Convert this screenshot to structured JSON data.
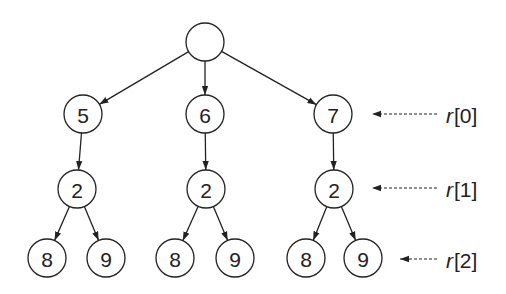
{
  "diagram": {
    "type": "tree",
    "colors": {
      "stroke": "#222222",
      "fill": "#ffffff",
      "background": "#ffffff"
    },
    "nodes": [
      {
        "id": "root",
        "label": "",
        "x": 205,
        "y": 42
      },
      {
        "id": "n5",
        "label": "5",
        "x": 83,
        "y": 114
      },
      {
        "id": "n6",
        "label": "6",
        "x": 205,
        "y": 114
      },
      {
        "id": "n7",
        "label": "7",
        "x": 333,
        "y": 114
      },
      {
        "id": "a2",
        "label": "2",
        "x": 77,
        "y": 189
      },
      {
        "id": "b2",
        "label": "2",
        "x": 206,
        "y": 189
      },
      {
        "id": "c2",
        "label": "2",
        "x": 334,
        "y": 189
      },
      {
        "id": "a8",
        "label": "8",
        "x": 47,
        "y": 258
      },
      {
        "id": "a9",
        "label": "9",
        "x": 106,
        "y": 258
      },
      {
        "id": "b8",
        "label": "8",
        "x": 175,
        "y": 258
      },
      {
        "id": "b9",
        "label": "9",
        "x": 235,
        "y": 258
      },
      {
        "id": "c8",
        "label": "8",
        "x": 306,
        "y": 258
      },
      {
        "id": "c9",
        "label": "9",
        "x": 363,
        "y": 258
      }
    ],
    "edges": [
      [
        "root",
        "n5"
      ],
      [
        "root",
        "n6"
      ],
      [
        "root",
        "n7"
      ],
      [
        "n5",
        "a2"
      ],
      [
        "n6",
        "b2"
      ],
      [
        "n7",
        "c2"
      ],
      [
        "a2",
        "a8"
      ],
      [
        "a2",
        "a9"
      ],
      [
        "b2",
        "b8"
      ],
      [
        "b2",
        "b9"
      ],
      [
        "c2",
        "c8"
      ],
      [
        "c2",
        "c9"
      ]
    ],
    "pointers": [
      {
        "var": "r",
        "index": "[0]",
        "y": 114,
        "from_x": 437,
        "to_x": 372
      },
      {
        "var": "r",
        "index": "[1]",
        "y": 188,
        "from_x": 437,
        "to_x": 372
      },
      {
        "var": "r",
        "index": "[2]",
        "y": 259,
        "from_x": 437,
        "to_x": 400
      }
    ]
  }
}
